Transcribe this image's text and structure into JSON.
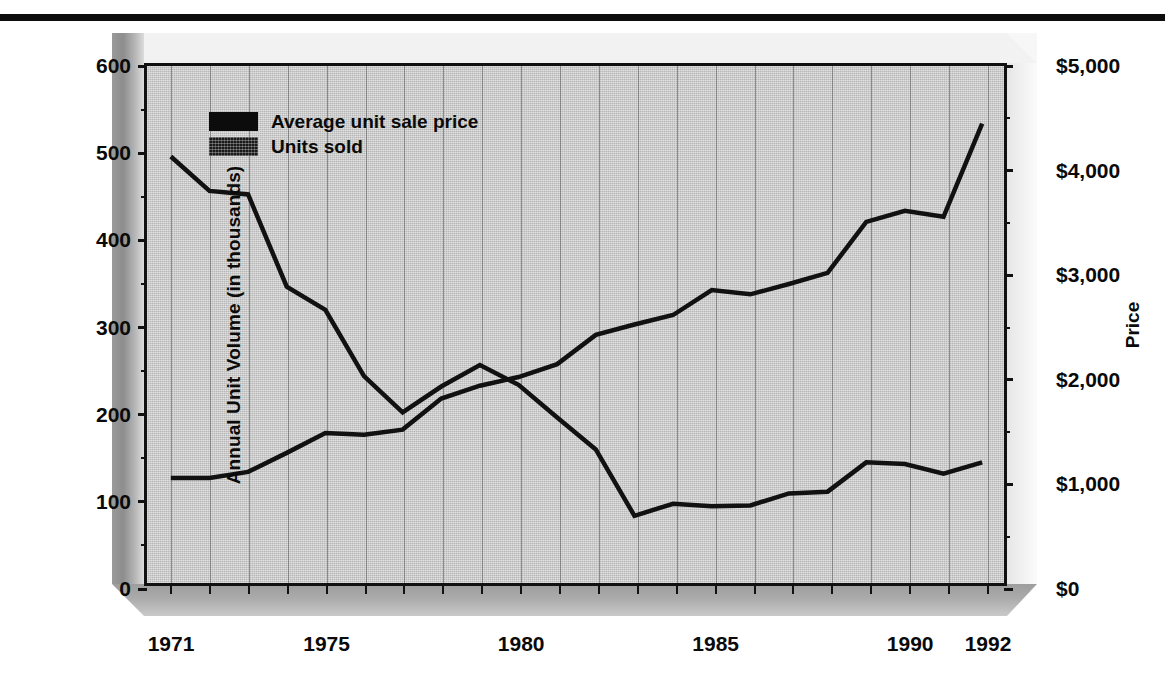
{
  "chart_data": {
    "type": "line",
    "title": "",
    "xlabel": "",
    "ylabel": "Annual Unit Volume (in thousands)",
    "ylabel_right": "Price",
    "grid": true,
    "legend_position": "top-left",
    "x": [
      1971,
      1972,
      1973,
      1974,
      1975,
      1976,
      1977,
      1978,
      1979,
      1980,
      1981,
      1982,
      1983,
      1984,
      1985,
      1986,
      1987,
      1988,
      1989,
      1990,
      1991,
      1992
    ],
    "xticks": [
      "1971",
      "1975",
      "1980",
      "1985",
      "1990",
      "1992"
    ],
    "xtick_values": [
      1971,
      1975,
      1980,
      1985,
      1990,
      1992
    ],
    "yticks_left": [
      "0",
      "100",
      "200",
      "300",
      "400",
      "500",
      "600"
    ],
    "ytick_values_left": [
      0,
      100,
      200,
      300,
      400,
      500,
      600
    ],
    "ylim_left": [
      0,
      600
    ],
    "yticks_right": [
      "$0",
      "$1,000",
      "$2,000",
      "$3,000",
      "$4,000",
      "$5,000"
    ],
    "ytick_values_right": [
      0,
      1000,
      2000,
      3000,
      4000,
      5000
    ],
    "ylim_right": [
      0,
      5000
    ],
    "series": [
      {
        "name": "Average unit sale price",
        "axis": "right",
        "unit": "USD",
        "values": [
          4125,
          3792,
          3758,
          2867,
          2642,
          2000,
          1650,
          1900,
          2108,
          1917,
          1600,
          1292,
          650,
          767,
          742,
          750,
          867,
          883,
          1167,
          1150,
          1058,
          1167
        ]
      },
      {
        "name": "Units sold",
        "axis": "left",
        "unit": "thousands",
        "values": [
          122,
          122,
          129,
          151,
          174,
          172,
          178,
          214,
          229,
          239,
          254,
          288,
          300,
          311,
          340,
          335,
          347,
          360,
          419,
          432,
          425,
          533
        ]
      }
    ],
    "series_left_scale_trace": {
      "average_unit_sale_price_on_left_scale": [
        495,
        455,
        451,
        344,
        317,
        240,
        198,
        228,
        253,
        230,
        192,
        155,
        78,
        92,
        89,
        90,
        104,
        106,
        140,
        138,
        127,
        140
      ]
    }
  },
  "legend": {
    "items": [
      {
        "label": "Average unit sale price",
        "swatch": "solid-black"
      },
      {
        "label": "Units sold",
        "swatch": "textured-dark"
      }
    ]
  },
  "colors": {
    "line": "#111111",
    "plot_background": "#c9c9c9",
    "gridline": "#6e6e6e",
    "axis": "#111111",
    "page_background": "#ffffff",
    "rule": "#0d0d0d"
  }
}
